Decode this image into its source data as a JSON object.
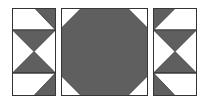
{
  "diagram": {
    "colors": {
      "fill": "#5f5f5f",
      "stroke": "#333333",
      "background": "#ffffff"
    },
    "panels": [
      {
        "name": "left-tile",
        "x": 12,
        "y": 8,
        "w": 43,
        "h": 87
      },
      {
        "name": "center-tile",
        "x": 61,
        "y": 8,
        "w": 86,
        "h": 87
      },
      {
        "name": "right-tile",
        "x": 153,
        "y": 8,
        "w": 43,
        "h": 87
      }
    ]
  }
}
